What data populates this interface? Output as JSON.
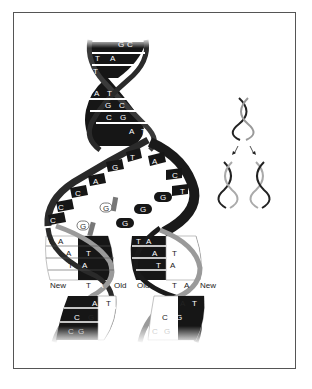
{
  "figure": {
    "colors": {
      "old_strand": "#1a1a1a",
      "new_strand": "#ffffff",
      "backbone_dark": "#2b2b2b",
      "backbone_light": "#8a8a8a",
      "free_nucleotide": "#777777",
      "frame_border": "#555555"
    },
    "parent_helix": {
      "pairs": [
        {
          "left": "G",
          "right": "C"
        },
        {
          "left": "T",
          "right": "A"
        },
        {
          "left": "T",
          "right": ""
        },
        {
          "left": "A",
          "right": "T"
        },
        {
          "left": "G",
          "right": "C"
        },
        {
          "left": "C",
          "right": "G"
        },
        {
          "left": "A",
          "right": "T"
        }
      ]
    },
    "unzipped_fork": {
      "left_strand_bases": [
        "T",
        "G",
        "A",
        "C",
        "C",
        "C"
      ],
      "right_strand_bases": [
        "A",
        "C",
        "T",
        "G",
        "G",
        "G"
      ],
      "free_nucleotides": [
        "G",
        "G"
      ]
    },
    "daughter_left": {
      "pairs": [
        {
          "left": "T",
          "right": "A"
        },
        {
          "left": "A",
          "right": "T"
        },
        {
          "left": "T",
          "right": "A"
        },
        {
          "left": "T",
          "right": "A"
        },
        {
          "left": "A",
          "right": "T"
        },
        {
          "left": "C",
          "right": "G"
        },
        {
          "left": "C",
          "right": "G"
        }
      ],
      "label_new": "New",
      "label_old": "Old"
    },
    "daughter_right": {
      "pairs": [
        {
          "left": "T",
          "right": "A"
        },
        {
          "left": "A",
          "right": "T"
        },
        {
          "left": "T",
          "right": "A"
        },
        {
          "left": "T",
          "right": "A"
        },
        {
          "left": "A",
          "right": "T"
        },
        {
          "left": "C",
          "right": "G"
        },
        {
          "left": "C",
          "right": "G"
        }
      ],
      "label_old": "Old",
      "label_new": "New"
    },
    "inset": {
      "description": "One helix splits into two identical helices",
      "arrows": [
        "down-left-arrow",
        "down-right-arrow"
      ]
    }
  }
}
